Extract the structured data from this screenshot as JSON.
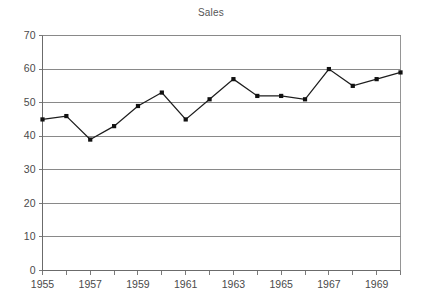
{
  "chart_data": {
    "type": "line",
    "title": "Sales",
    "xlabel": "",
    "ylabel": "",
    "x": [
      1955,
      1956,
      1957,
      1958,
      1959,
      1960,
      1961,
      1962,
      1963,
      1964,
      1965,
      1966,
      1967,
      1968,
      1969,
      1970
    ],
    "values": [
      45,
      46,
      39,
      43,
      49,
      53,
      45,
      51,
      57,
      52,
      52,
      51,
      60,
      55,
      57,
      59
    ],
    "series": [
      {
        "name": "Sales",
        "values": [
          45,
          46,
          39,
          43,
          49,
          53,
          45,
          51,
          57,
          52,
          52,
          51,
          60,
          55,
          57,
          59
        ]
      }
    ],
    "categories": [
      "1955",
      "1956",
      "1957",
      "1958",
      "1959",
      "1960",
      "1961",
      "1962",
      "1963",
      "1964",
      "1965",
      "1966",
      "1967",
      "1968",
      "1969",
      "1970"
    ],
    "ylim": [
      0,
      70
    ],
    "xlim": [
      1955,
      1970
    ],
    "ytick_labels": [
      "70",
      "60",
      "50",
      "40",
      "30",
      "20",
      "10",
      "0"
    ],
    "ytick_values": [
      70,
      60,
      50,
      40,
      30,
      20,
      10,
      0
    ],
    "xtick_values": [
      1955,
      1956,
      1957,
      1958,
      1959,
      1960,
      1961,
      1962,
      1963,
      1964,
      1965,
      1966,
      1967,
      1968,
      1969,
      1970
    ],
    "xtick_labels": [
      "1955",
      "",
      "1957",
      "",
      "1959",
      "",
      "1961",
      "",
      "1963",
      "",
      "1965",
      "",
      "1967",
      "",
      "1969",
      ""
    ],
    "xtick_labels_shown": [
      "1955",
      "1957",
      "1959",
      "1961",
      "1963",
      "1965",
      "1967",
      "1969"
    ],
    "grid": true,
    "grid_axis": "y",
    "legend": false,
    "legend_position": "none",
    "marker": "square",
    "line_color": "#1d1d1d",
    "marker_color": "#111111",
    "grid_color": "#7c7c7c",
    "axis_color": "#6b6b6b",
    "text_color": "#4a4a4a",
    "background": "#ffffff",
    "annotations": []
  }
}
